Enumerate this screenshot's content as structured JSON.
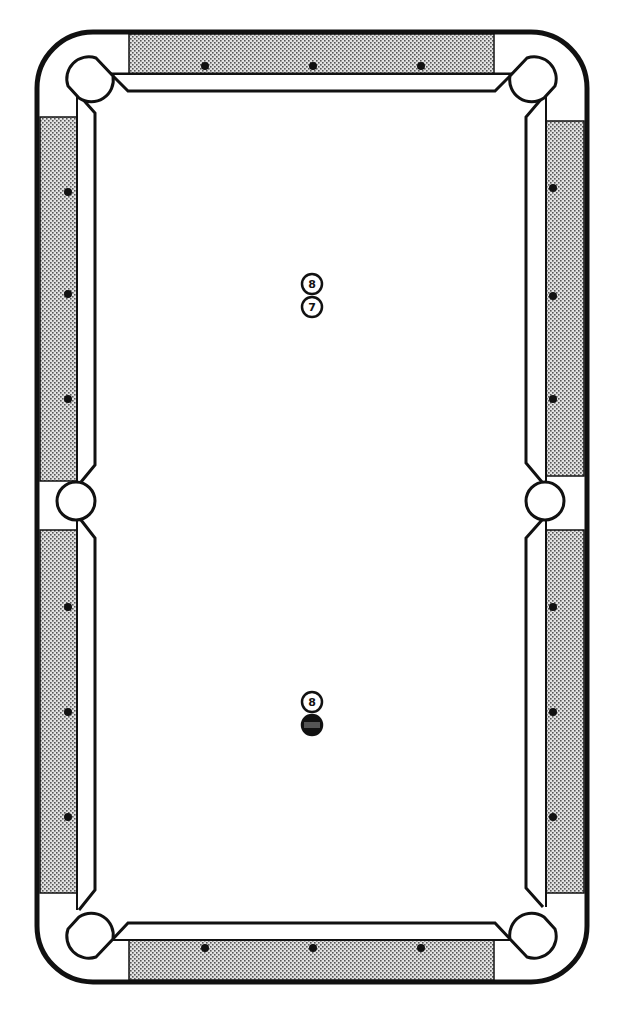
{
  "diagram": {
    "colors": {
      "line": "#111111",
      "rail_fill": "#c8c8c8",
      "cloth": "#ffffff",
      "diamond": "#111111"
    },
    "table": {
      "outer": {
        "x": 37,
        "y": 32,
        "w": 550,
        "h": 950,
        "radius": 56
      },
      "diamonds": {
        "top": [
          {
            "x": 205,
            "y": 66
          },
          {
            "x": 313,
            "y": 66
          },
          {
            "x": 421,
            "y": 66
          }
        ],
        "bottom": [
          {
            "x": 205,
            "y": 948
          },
          {
            "x": 313,
            "y": 948
          },
          {
            "x": 421,
            "y": 948
          }
        ],
        "left": [
          {
            "x": 68,
            "y": 192
          },
          {
            "x": 68,
            "y": 294
          },
          {
            "x": 68,
            "y": 399
          },
          {
            "x": 68,
            "y": 607
          },
          {
            "x": 68,
            "y": 712
          },
          {
            "x": 68,
            "y": 817
          }
        ],
        "right": [
          {
            "x": 553,
            "y": 188
          },
          {
            "x": 553,
            "y": 296
          },
          {
            "x": 553,
            "y": 399
          },
          {
            "x": 553,
            "y": 607
          },
          {
            "x": 553,
            "y": 712
          },
          {
            "x": 553,
            "y": 817
          }
        ]
      },
      "pockets": [
        {
          "name": "top-left",
          "x": 84,
          "y": 70
        },
        {
          "name": "top-right",
          "x": 539,
          "y": 70
        },
        {
          "name": "middle-left",
          "x": 76,
          "y": 501
        },
        {
          "name": "middle-right",
          "x": 545,
          "y": 501
        },
        {
          "name": "bottom-left",
          "x": 84,
          "y": 945
        },
        {
          "name": "bottom-right",
          "x": 539,
          "y": 945
        }
      ]
    },
    "balls": [
      {
        "id": "ball-top-1",
        "label": "8",
        "x": 312,
        "y": 284,
        "style": "solid-outline"
      },
      {
        "id": "ball-top-2",
        "label": "7",
        "x": 312,
        "y": 307,
        "style": "outline"
      },
      {
        "id": "ball-bottom-1",
        "label": "8",
        "x": 312,
        "y": 702,
        "style": "outline"
      },
      {
        "id": "ball-bottom-2",
        "label": "",
        "x": 312,
        "y": 725,
        "style": "dark-striped"
      }
    ]
  }
}
